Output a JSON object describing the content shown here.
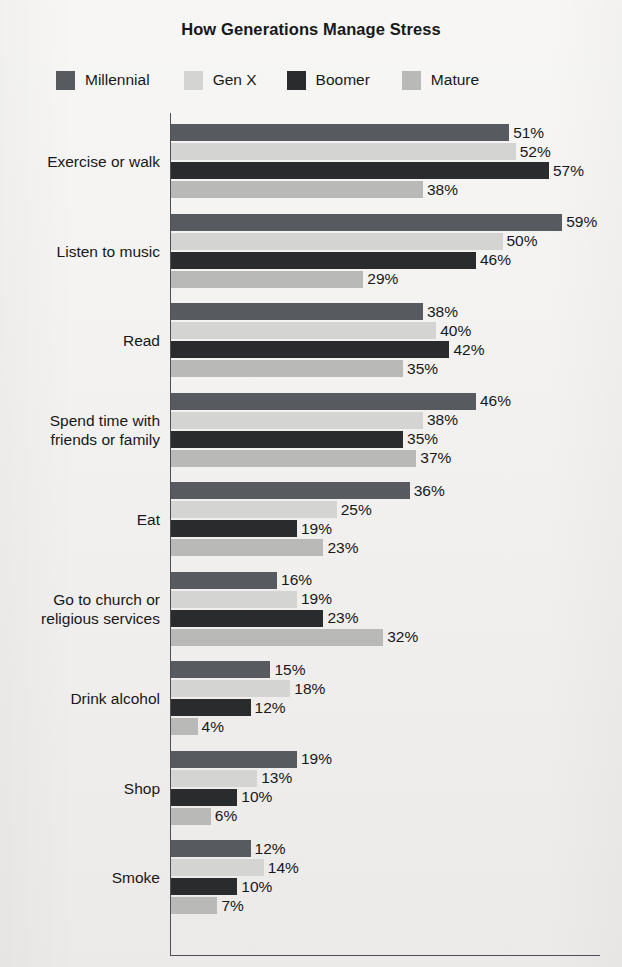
{
  "chart_data": {
    "type": "bar",
    "orientation": "horizontal",
    "title": "How Generations Manage Stress",
    "xlabel": "",
    "ylabel": "",
    "xlim": [
      0,
      65
    ],
    "grid": false,
    "legend_position": "top",
    "value_suffix": "%",
    "categories": [
      "Exercise or walk",
      "Listen to music",
      "Read",
      "Spend time with\nfriends or family",
      "Eat",
      "Go to church or\nreligious services",
      "Drink alcohol",
      "Shop",
      "Smoke"
    ],
    "series": [
      {
        "name": "Millennial",
        "color": "#575a5e",
        "values": [
          51,
          59,
          38,
          46,
          36,
          16,
          15,
          19,
          12
        ],
        "labels": [
          "51%",
          "59%",
          "38%",
          "46%",
          "36%",
          "16%",
          "15%",
          "19%",
          "12%"
        ]
      },
      {
        "name": "Gen X",
        "color": "#d4d5d3",
        "values": [
          52,
          50,
          40,
          38,
          25,
          19,
          18,
          13,
          14
        ],
        "labels": [
          "52%",
          "50%",
          "40%",
          "38%",
          "25%",
          "19%",
          "18%",
          "13%",
          "14%"
        ]
      },
      {
        "name": "Boomer",
        "color": "#2a2b2d",
        "values": [
          57,
          46,
          42,
          35,
          19,
          23,
          12,
          10,
          10
        ],
        "labels": [
          "57%",
          "46%",
          "42%",
          "35%",
          "19%",
          "23%",
          "12%",
          "10%",
          "10%"
        ]
      },
      {
        "name": "Mature",
        "color": "#b9bab7",
        "values": [
          38,
          29,
          35,
          37,
          23,
          32,
          4,
          6,
          7
        ],
        "labels": [
          "38%",
          "29%",
          "35%",
          "37%",
          "23%",
          "32%",
          "4%",
          "6%",
          "7%"
        ]
      }
    ]
  },
  "legend": {
    "items": [
      {
        "label": "Millennial",
        "color": "#575a5e"
      },
      {
        "label": "Gen X",
        "color": "#d4d5d3"
      },
      {
        "label": "Boomer",
        "color": "#2a2b2d"
      },
      {
        "label": "Mature",
        "color": "#b9bab7"
      }
    ]
  }
}
